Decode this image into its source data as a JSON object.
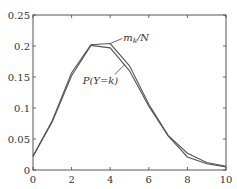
{
  "chart_data": {
    "type": "line",
    "title": "",
    "xlabel": "",
    "ylabel": "",
    "xlim": [
      0,
      10
    ],
    "ylim": [
      0,
      0.25
    ],
    "grid": false,
    "legend": "none (inline annotations)",
    "x": [
      0,
      1,
      2,
      3,
      4,
      5,
      6,
      7,
      8,
      9,
      10
    ],
    "series": [
      {
        "name": "m_k/N",
        "values": [
          0.022,
          0.08,
          0.157,
          0.202,
          0.204,
          0.168,
          0.106,
          0.056,
          0.027,
          0.012,
          0.006
        ]
      },
      {
        "name": "P(Y=k)",
        "values": [
          0.022,
          0.078,
          0.152,
          0.201,
          0.197,
          0.16,
          0.103,
          0.055,
          0.021,
          0.01,
          0.005
        ]
      }
    ],
    "x_ticks": [
      "0",
      "2",
      "4",
      "6",
      "8",
      "10"
    ],
    "y_ticks": [
      "0",
      "0.05",
      "0.1",
      "0.15",
      "0.2",
      "0.25"
    ],
    "annotations": [
      {
        "text": "m_k/N",
        "target_series": "m_k/N",
        "at_x": 4
      },
      {
        "text": "P(Y=k)",
        "target_series": "P(Y=k)",
        "at_x": 4.8
      }
    ],
    "line_color": "#555555"
  }
}
